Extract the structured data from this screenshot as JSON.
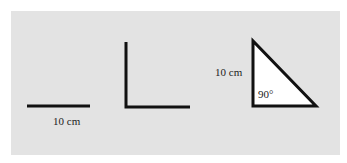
{
  "figure": {
    "background_color": "#e3e3e3",
    "stroke_color": "#111111",
    "shapes": [
      {
        "name": "line-segment",
        "type": "line",
        "points": [
          [
            27,
            106
          ],
          [
            90,
            106
          ]
        ],
        "label": "10 cm"
      },
      {
        "name": "right-angle",
        "type": "polyline",
        "points": [
          [
            126,
            42
          ],
          [
            126,
            107
          ],
          [
            190,
            107
          ]
        ]
      },
      {
        "name": "right-triangle",
        "type": "polygon",
        "fill": "#ffffff",
        "points": [
          [
            253,
            41
          ],
          [
            253,
            106
          ],
          [
            316,
            106
          ]
        ],
        "side_label": "10 cm",
        "angle_label": "90°"
      }
    ]
  },
  "labels": {
    "segment_length": "10 cm",
    "triangle_side": "10 cm",
    "triangle_angle": "90°"
  }
}
